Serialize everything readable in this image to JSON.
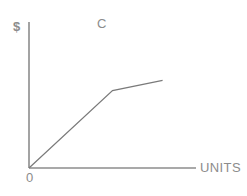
{
  "chart_data": {
    "type": "line",
    "title": "C",
    "xlabel": "UNITS",
    "ylabel": "$",
    "origin_label": "0",
    "grid": false,
    "legend": null,
    "axis_color": "#8c8c8c",
    "line_color": "#7a7a7a",
    "background_color": "#ffffff",
    "xlim": [
      0,
      100
    ],
    "ylim": [
      0,
      100
    ],
    "axes": {
      "x_axis": {
        "x_start": 0,
        "x_end": 100,
        "y": 0
      },
      "y_axis": {
        "y_start": 0,
        "y_end": 100,
        "x": 0
      }
    },
    "series": [
      {
        "name": "C",
        "points": [
          {
            "x": 0,
            "y": 0
          },
          {
            "x": 50,
            "y": 53
          },
          {
            "x": 80,
            "y": 60
          }
        ],
        "description": "Total cost curve: steep linear rise from origin, then a shallower linear segment after the kink"
      }
    ],
    "annotations": [
      {
        "label": "C",
        "x": 50,
        "y": 98
      }
    ]
  }
}
